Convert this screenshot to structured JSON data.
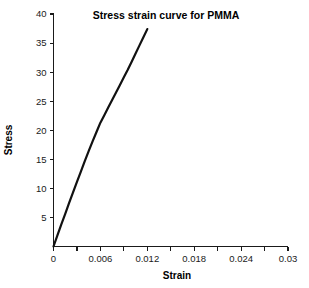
{
  "chart_data": {
    "type": "line",
    "title": "Stress strain curve for PMMA",
    "xlabel": "Strain",
    "ylabel": "Stress",
    "xlim": [
      0,
      0.03
    ],
    "ylim": [
      0,
      40
    ],
    "grid": false,
    "legend": null,
    "x_ticks": [
      {
        "value": 0,
        "label": "0"
      },
      {
        "value": 0.003,
        "label": ""
      },
      {
        "value": 0.006,
        "label": "0.006"
      },
      {
        "value": 0.009,
        "label": ""
      },
      {
        "value": 0.012,
        "label": "0.012"
      },
      {
        "value": 0.015,
        "label": ""
      },
      {
        "value": 0.018,
        "label": "0.018"
      },
      {
        "value": 0.021,
        "label": ""
      },
      {
        "value": 0.024,
        "label": "0.024"
      },
      {
        "value": 0.027,
        "label": ""
      },
      {
        "value": 0.03,
        "label": "0.03"
      }
    ],
    "y_ticks": [
      {
        "value": 5,
        "label": "5"
      },
      {
        "value": 10,
        "label": "10"
      },
      {
        "value": 15,
        "label": "15"
      },
      {
        "value": 20,
        "label": "20"
      },
      {
        "value": 25,
        "label": "25"
      },
      {
        "value": 30,
        "label": "30"
      },
      {
        "value": 35,
        "label": "35"
      },
      {
        "value": 40,
        "label": "40"
      }
    ],
    "series": [
      {
        "name": "PMMA stress-strain",
        "color": "#111111",
        "x": [
          0.0,
          0.0005,
          0.001,
          0.0015,
          0.002,
          0.0025,
          0.003,
          0.0035,
          0.004,
          0.0045,
          0.005,
          0.0055,
          0.006,
          0.0065,
          0.007,
          0.0075,
          0.008,
          0.0085,
          0.009,
          0.0095,
          0.01,
          0.0105,
          0.011,
          0.0115,
          0.012
        ],
        "y": [
          0.0,
          1.9,
          3.8,
          5.6,
          7.5,
          9.3,
          11.1,
          12.9,
          14.7,
          16.4,
          18.1,
          19.7,
          21.3,
          22.6,
          23.9,
          25.2,
          26.5,
          27.8,
          29.1,
          30.4,
          31.8,
          33.2,
          34.6,
          36.0,
          37.4
        ]
      }
    ]
  }
}
